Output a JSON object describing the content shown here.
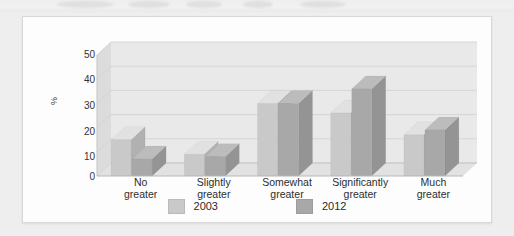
{
  "card": {
    "background_color": "#fdfdfd",
    "page_background_color": "#efefef"
  },
  "chart_data": {
    "type": "bar",
    "title": "",
    "subtitle": "",
    "xlabel": "",
    "ylabel": "%",
    "ylim": [
      0,
      50
    ],
    "yticks": [
      0,
      10,
      20,
      30,
      40,
      50
    ],
    "ytick_labels": [
      "0",
      "10",
      "20",
      "30",
      "40",
      "50"
    ],
    "grid": true,
    "grid_axis": "y",
    "legend_position": "bottom",
    "three_d": true,
    "categories": [
      "No greater",
      "Slightly greater",
      "Somewhat greater",
      "Significantly greater",
      "Much greater"
    ],
    "category_lines": [
      [
        "No",
        "greater"
      ],
      [
        "Slightly",
        "greater"
      ],
      [
        "Somewhat",
        "greater"
      ],
      [
        "Significantly",
        "greater"
      ],
      [
        "Much",
        "greater"
      ]
    ],
    "series": [
      {
        "name": "2003",
        "color": "#c9c9c9",
        "values": [
          15,
          9,
          30,
          26,
          17
        ]
      },
      {
        "name": "2012",
        "color": "#a8a8a8",
        "values": [
          7,
          8,
          30,
          36,
          19
        ]
      }
    ]
  },
  "legend": {
    "items": [
      {
        "label": "2003",
        "color": "#c9c9c9"
      },
      {
        "label": "2012",
        "color": "#a8a8a8"
      }
    ]
  },
  "axis": {
    "y_title": "%"
  }
}
